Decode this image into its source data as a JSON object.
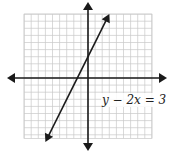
{
  "figure": {
    "type": "coordinate-plane-graph",
    "equation_label": "y − 2x = 3",
    "grid": {
      "x_min": -9,
      "x_max": 9,
      "y_min": -8.5,
      "y_max": 9,
      "unit_px": 7.1,
      "origin_px": [
        88,
        78
      ],
      "grid_color": "#c8c8c8",
      "axis_color": "#1a1a1a",
      "line_color": "#1a1a1a"
    },
    "axes": {
      "x_axis": {
        "arrows": [
          "left",
          "right"
        ],
        "label": ""
      },
      "y_axis": {
        "arrows": [
          "up",
          "down"
        ],
        "label": ""
      }
    },
    "line": {
      "equation": "y = 2x + 3",
      "slope": 2,
      "y_intercept": 3,
      "x_intercept": -1.5,
      "arrows": [
        "both"
      ],
      "start": [
        -6,
        -9
      ],
      "end": [
        3,
        9
      ]
    }
  }
}
